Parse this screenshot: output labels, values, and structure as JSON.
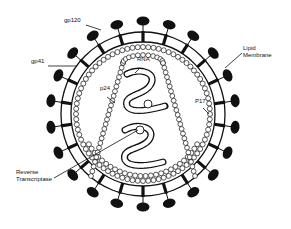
{
  "diagram": {
    "colors": {
      "ink": "#111111",
      "background": "#ffffff"
    },
    "center": {
      "x": 143,
      "y": 114
    },
    "envelope": {
      "outer_radius": 82,
      "inner_radius": 72,
      "knob_radius": 93,
      "knob_count": 22,
      "knob_rx": 6.5,
      "knob_ry": 4.5
    },
    "matrix_ring": {
      "bead_radius": 67,
      "inner_bead_radius": 62,
      "bead_size": 2.5,
      "bead_count": 80
    },
    "capsid": {
      "top_y": 55,
      "top_half_width": 20,
      "bottom_y": 176,
      "bottom_half_width": 52,
      "bead_size": 2.4
    },
    "labels": [
      {
        "id": "gp120",
        "text": "gp120",
        "x": 64,
        "y": 22,
        "line": [
          [
            86,
            25
          ],
          [
            101,
            30
          ]
        ]
      },
      {
        "id": "gp41",
        "text": "gp41",
        "x": 31,
        "y": 63,
        "line": [
          [
            48,
            66
          ],
          [
            77,
            66
          ]
        ]
      },
      {
        "id": "lipid-membrane",
        "text": "Lipid\nMembrane",
        "x": 243,
        "y": 50,
        "line": [
          [
            242,
            53
          ],
          [
            225,
            68
          ]
        ]
      },
      {
        "id": "rna",
        "text": "RNA",
        "x": 137,
        "y": 61,
        "line": [
          [
            140,
            68
          ],
          [
            135,
            73
          ]
        ]
      },
      {
        "id": "p24",
        "text": "p24",
        "x": 100,
        "y": 90,
        "line": [
          [
            107,
            97
          ],
          [
            115,
            103
          ]
        ]
      },
      {
        "id": "p17",
        "text": "P17",
        "x": 195,
        "y": 103,
        "line": [
          [
            203,
            108
          ],
          [
            209,
            114
          ]
        ]
      },
      {
        "id": "reverse-transcriptase",
        "text": "Reverse\nTranscriptase",
        "x": 16,
        "y": 174,
        "line": [
          [
            54,
            178
          ],
          [
            138,
            130
          ]
        ]
      }
    ]
  }
}
